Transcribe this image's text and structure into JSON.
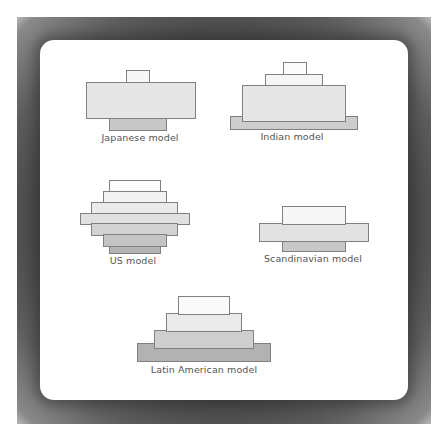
{
  "figure": {
    "colors": {
      "frame": "#555555",
      "panel": "#ffffff",
      "stroke": "#808080",
      "label": "#555555",
      "shade_white": "#fcfcfc",
      "shade_1": "#f3f3f3",
      "shade_2": "#e8e8e8",
      "shade_3": "#dcdcdc",
      "shade_4": "#cdcdcd",
      "shade_5": "#bfbfbf",
      "shade_6": "#ababab"
    },
    "models": [
      {
        "id": "japanese",
        "label": "Japanese model",
        "label_pos": {
          "x": 140,
          "y": 132
        },
        "layers": [
          {
            "x": 126,
            "y": 70,
            "w": 24,
            "h": 13,
            "fill": "#f7f7f7"
          },
          {
            "x": 86,
            "y": 82,
            "w": 110,
            "h": 37,
            "fill": "#e6e6e6"
          },
          {
            "x": 109,
            "y": 118,
            "w": 58,
            "h": 13,
            "fill": "#c8c8c8"
          }
        ]
      },
      {
        "id": "indian",
        "label": "Indian model",
        "label_pos": {
          "x": 292,
          "y": 131
        },
        "layers": [
          {
            "x": 230,
            "y": 116,
            "w": 128,
            "h": 14,
            "fill": "#cdcdcd"
          },
          {
            "x": 242,
            "y": 85,
            "w": 104,
            "h": 37,
            "fill": "#e6e6e6"
          },
          {
            "x": 265,
            "y": 74,
            "w": 58,
            "h": 12,
            "fill": "#f5f5f5"
          },
          {
            "x": 283,
            "y": 62,
            "w": 24,
            "h": 13,
            "fill": "#fcfcfc"
          }
        ]
      },
      {
        "id": "us",
        "label": "US model",
        "label_pos": {
          "x": 133,
          "y": 255
        },
        "layers": [
          {
            "x": 109,
            "y": 180,
            "w": 52,
            "h": 13,
            "fill": "#fcfcfc"
          },
          {
            "x": 103,
            "y": 191,
            "w": 64,
            "h": 13,
            "fill": "#f3f3f3"
          },
          {
            "x": 91,
            "y": 202,
            "w": 87,
            "h": 13,
            "fill": "#ebebeb"
          },
          {
            "x": 80,
            "y": 213,
            "w": 110,
            "h": 12,
            "fill": "#e0e0e0"
          },
          {
            "x": 91,
            "y": 223,
            "w": 87,
            "h": 13,
            "fill": "#d2d2d2"
          },
          {
            "x": 103,
            "y": 234,
            "w": 64,
            "h": 13,
            "fill": "#c4c4c4"
          },
          {
            "x": 109,
            "y": 246,
            "w": 52,
            "h": 8,
            "fill": "#b4b4b4"
          }
        ]
      },
      {
        "id": "scandinavian",
        "label": "Scandinavian model",
        "label_pos": {
          "x": 313,
          "y": 253
        },
        "layers": [
          {
            "x": 282,
            "y": 241,
            "w": 64,
            "h": 11,
            "fill": "#c8c8c8"
          },
          {
            "x": 259,
            "y": 223,
            "w": 110,
            "h": 19,
            "fill": "#e2e2e2"
          },
          {
            "x": 282,
            "y": 206,
            "w": 64,
            "h": 19,
            "fill": "#f7f7f7"
          }
        ]
      },
      {
        "id": "latin-american",
        "label": "Latin American model",
        "label_pos": {
          "x": 204,
          "y": 364
        },
        "layers": [
          {
            "x": 137,
            "y": 343,
            "w": 134,
            "h": 19,
            "fill": "#b2b2b2"
          },
          {
            "x": 154,
            "y": 330,
            "w": 100,
            "h": 19,
            "fill": "#cecece"
          },
          {
            "x": 166,
            "y": 313,
            "w": 76,
            "h": 19,
            "fill": "#eaeaea"
          },
          {
            "x": 178,
            "y": 296,
            "w": 52,
            "h": 19,
            "fill": "#fafafa"
          }
        ]
      }
    ]
  }
}
